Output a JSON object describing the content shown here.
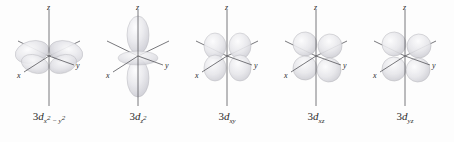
{
  "figure": {
    "name": "3d-orbital-shapes",
    "background_color": "#fdfdfd",
    "axis_color": "#55555a",
    "lobe_fill_light": "#f3f3f5",
    "lobe_fill_mid": "#d9d9dd",
    "lobe_stroke": "#b4b4ba",
    "label_color": "#2c2c2c"
  },
  "axis_labels": {
    "z": "z",
    "x": "x",
    "y": "y"
  },
  "orbitals": [
    {
      "id": "3d-x2-y2",
      "prefix": "3",
      "d": "d",
      "sub_main": "x",
      "sub_sup1": "2",
      "sub_minus": "−",
      "sub_second": "y",
      "sub_sup2": "2",
      "label_plain": "3d x² − y²",
      "kind": "cloverleaf-on-axes",
      "lobe_count": 4
    },
    {
      "id": "3d-z2",
      "prefix": "3",
      "d": "d",
      "sub_main": "z",
      "sub_sup1": "2",
      "label_plain": "3d z²",
      "kind": "dumbbell-with-torus",
      "lobe_count": 2
    },
    {
      "id": "3d-xy",
      "prefix": "3",
      "d": "d",
      "sub_main": "xy",
      "label_plain": "3d xy",
      "kind": "cloverleaf-between-axes",
      "lobe_count": 4
    },
    {
      "id": "3d-xz",
      "prefix": "3",
      "d": "d",
      "sub_main": "xz",
      "label_plain": "3d xz",
      "kind": "cloverleaf-between-axes",
      "lobe_count": 4
    },
    {
      "id": "3d-yz",
      "prefix": "3",
      "d": "d",
      "sub_main": "yz",
      "label_plain": "3d yz",
      "kind": "cloverleaf-between-axes",
      "lobe_count": 4
    }
  ]
}
